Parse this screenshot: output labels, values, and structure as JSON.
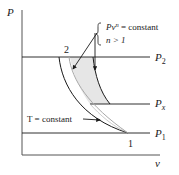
{
  "diagram": {
    "type": "P-v diagram",
    "axes": {
      "y_label": "P",
      "x_label": "v"
    },
    "pressure_lines": [
      {
        "id": "P2",
        "base": "P",
        "sub": "2"
      },
      {
        "id": "Px",
        "base": "P",
        "sub": "x"
      },
      {
        "id": "P1",
        "base": "P",
        "sub": "1"
      }
    ],
    "states": [
      {
        "id": "1",
        "label": "1"
      },
      {
        "id": "2",
        "label": "2"
      }
    ],
    "annotations": {
      "polytropic_line1_pre": "Pv",
      "polytropic_line1_exp": "n",
      "polytropic_line1_post": " = constant",
      "polytropic_line2": "n > 1",
      "isothermal": "T = constant"
    },
    "colors": {
      "ink": "#1a1a1a",
      "polytropic_curve": "#a8a8a8",
      "shaded_region": "#e6e6e6"
    }
  }
}
